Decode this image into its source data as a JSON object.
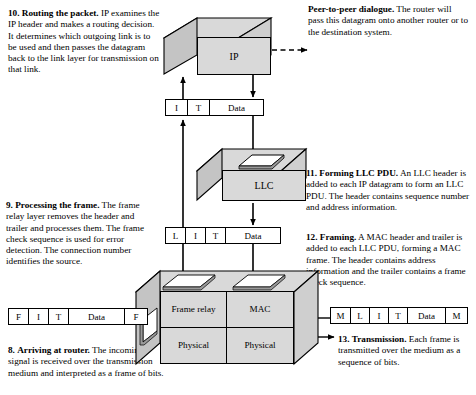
{
  "diagram": {
    "notes": {
      "routing_packet": {
        "number": "10.",
        "heading": "Routing the packet.",
        "body": " IP examines the IP header and makes a routing decision. It determines which outgoing link is to be used and then passes the datagram back to the link layer for transmission on that link."
      },
      "peer_dialogue": {
        "heading": "Peer-to-peer dialogue.",
        "body": " The router will pass this datagram onto another router or to the destination system."
      },
      "processing_frame": {
        "number": "9.",
        "heading": "Processing the frame.",
        "body": " The frame relay layer removes the header and trailer and processes them. The frame check sequence is used for error detection. The connection number identifies the source."
      },
      "forming_llc_pdu": {
        "number": "11.",
        "heading": "Forming LLC PDU.",
        "body": " An LLC header is added to each IP datagram to form an LLC PDU. The header contains sequence number and address information."
      },
      "framing": {
        "number": "12.",
        "heading": "Framing.",
        "body": " A MAC header and trailer is added to each LLC PDU, forming a MAC frame. The header contains address information and the trailer contains a frame check sequence."
      },
      "arriving_at_router": {
        "number": "8.",
        "heading": "Arriving at router.",
        "body": " The incoming signal is received over the transmission medium and interpreted as a frame of bits."
      },
      "transmission": {
        "number": "13.",
        "heading": "Transmission.",
        "body": " Each frame is transmitted over the medium as a sequence of bits."
      }
    },
    "boxes": {
      "ip": {
        "label": "IP"
      },
      "llc": {
        "label": "LLC"
      },
      "router": {
        "cells": [
          {
            "label": "Frame relay"
          },
          {
            "label": "MAC"
          },
          {
            "label": "Physical"
          },
          {
            "label": "Physical"
          }
        ]
      }
    },
    "pdus": {
      "ip_datagram": {
        "name": "IP datagram",
        "cells": [
          {
            "label": "I",
            "width": 22
          },
          {
            "label": "T",
            "width": 22
          },
          {
            "label": "Data",
            "width": 55
          }
        ]
      },
      "llc_pdu": {
        "name": "LLC PDU",
        "cells": [
          {
            "label": "L",
            "width": 20
          },
          {
            "label": "I",
            "width": 20
          },
          {
            "label": "T",
            "width": 20
          },
          {
            "label": "Data",
            "width": 56
          }
        ]
      },
      "incoming_frame": {
        "name": "Frame relay frame",
        "cells": [
          {
            "label": "F",
            "width": 20
          },
          {
            "label": "I",
            "width": 20
          },
          {
            "label": "T",
            "width": 20
          },
          {
            "label": "Data",
            "width": 60
          },
          {
            "label": "F",
            "width": 20
          }
        ]
      },
      "outgoing_frame": {
        "name": "MAC frame",
        "cells": [
          {
            "label": "M",
            "width": 20
          },
          {
            "label": "L",
            "width": 19
          },
          {
            "label": "I",
            "width": 19
          },
          {
            "label": "T",
            "width": 19
          },
          {
            "label": "Data",
            "width": 41
          },
          {
            "label": "M",
            "width": 20
          }
        ]
      }
    },
    "colors": {
      "box_face": "#d9d9d9",
      "box_side": "#c9c9c9",
      "outline": "#000000",
      "background": "#ffffff"
    }
  }
}
